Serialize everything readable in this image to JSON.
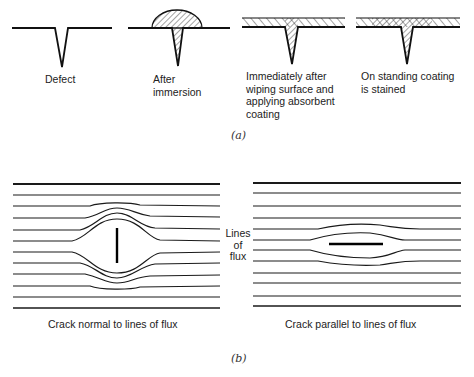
{
  "part_a": {
    "caption": "(a)",
    "stages": [
      {
        "id": "defect",
        "label_lines": [
          "Defect"
        ]
      },
      {
        "id": "after-immersion",
        "label_lines": [
          "After",
          "immersion"
        ]
      },
      {
        "id": "after-wiping",
        "label_lines": [
          "Immediately after",
          "wiping surface and",
          "applying absorbent",
          "coating"
        ]
      },
      {
        "id": "on-standing",
        "label_lines": [
          "On standing coating",
          "is stained"
        ]
      }
    ]
  },
  "part_b": {
    "caption": "(b)",
    "center_label_lines": [
      "Lines",
      "of",
      "flux"
    ],
    "left_panel": {
      "label": "Crack normal to lines of flux"
    },
    "right_panel": {
      "label": "Crack parallel to lines of flux"
    }
  }
}
